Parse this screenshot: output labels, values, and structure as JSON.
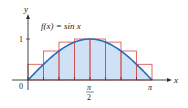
{
  "chart_data": {
    "type": "area",
    "title": "",
    "function_label": "f(x) = sin x",
    "xlabel": "x",
    "ylabel": "y",
    "x_ticks": [
      "0",
      "π/2",
      "π"
    ],
    "y_ticks": [
      "1"
    ],
    "xlim": [
      0,
      3.14159
    ],
    "ylim": [
      0,
      1
    ],
    "n_rectangles": 8,
    "rectangle_heights": [
      0.383,
      0.707,
      0.924,
      1.0,
      1.0,
      0.924,
      0.707,
      0.383
    ],
    "curve": "sin x",
    "colors": {
      "curve": "#2a6bb5",
      "fill": "#cfe2f5",
      "rectangles": "#d84a4a",
      "axis": "#333333"
    }
  },
  "labels": {
    "function": "f(x) = sin x",
    "x_axis": "x",
    "y_axis": "y",
    "origin": "0",
    "y_one": "1",
    "half_pi_num": "π",
    "half_pi_den": "2",
    "pi": "π"
  }
}
